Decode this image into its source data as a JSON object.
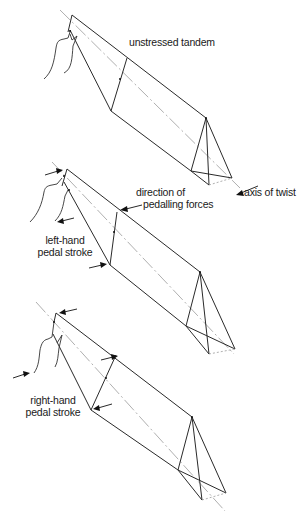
{
  "figure": {
    "panels": [
      {
        "id": "unstressed",
        "label": "unstressed tandem"
      },
      {
        "id": "left-hand",
        "label_lines": [
          "left-hand",
          "pedal stroke"
        ]
      },
      {
        "id": "right-hand",
        "label_lines": [
          "right-hand",
          "pedal stroke"
        ]
      }
    ],
    "annotations": {
      "direction_lines": [
        "direction of",
        "pedalling forces"
      ],
      "axis_of_twist": "axis of twist"
    },
    "colors": {
      "line": "#2a2a2a",
      "axis": "#9a9a9a",
      "background": "#ffffff"
    }
  }
}
